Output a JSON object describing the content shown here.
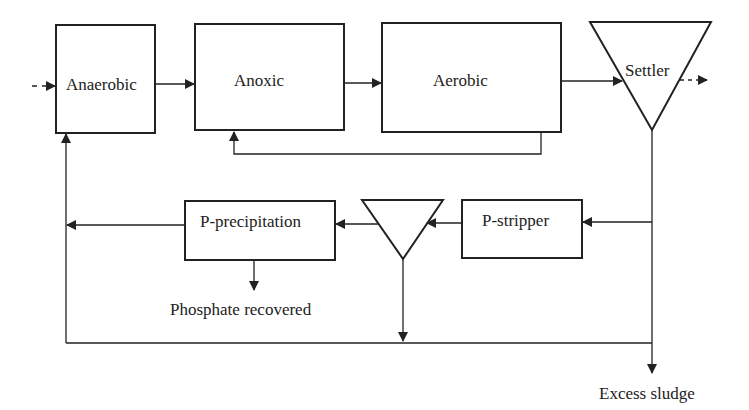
{
  "diagram": {
    "type": "process-flow",
    "stroke_color": "#222222",
    "background": "#ffffff",
    "nodes": [
      {
        "id": "anaerobic",
        "label": "Anaerobic",
        "shape": "rectangle"
      },
      {
        "id": "anoxic",
        "label": "Anoxic",
        "shape": "rectangle"
      },
      {
        "id": "aerobic",
        "label": "Aerobic",
        "shape": "rectangle"
      },
      {
        "id": "settler",
        "label": "Settler",
        "shape": "inverted-triangle"
      },
      {
        "id": "p_stripper",
        "label": "P-stripper",
        "shape": "rectangle"
      },
      {
        "id": "thickener",
        "label": "",
        "shape": "inverted-triangle"
      },
      {
        "id": "p_precipitation",
        "label": "P-precipitation",
        "shape": "rectangle"
      }
    ],
    "outputs": {
      "phosphate": "Phosphate recovered",
      "sludge": "Excess sludge"
    },
    "edges": [
      {
        "from": "influent",
        "to": "anaerobic",
        "style": "dashed"
      },
      {
        "from": "anaerobic",
        "to": "anoxic"
      },
      {
        "from": "anoxic",
        "to": "aerobic"
      },
      {
        "from": "aerobic",
        "to": "settler"
      },
      {
        "from": "settler",
        "to": "effluent",
        "style": "dashed"
      },
      {
        "from": "aerobic",
        "to": "anoxic",
        "note": "internal recycle"
      },
      {
        "from": "settler",
        "to": "p_stripper"
      },
      {
        "from": "p_stripper",
        "to": "thickener"
      },
      {
        "from": "thickener",
        "to": "p_precipitation"
      },
      {
        "from": "p_precipitation",
        "to": "anaerobic"
      },
      {
        "from": "p_precipitation",
        "to": "phosphate_recovered"
      },
      {
        "from": "thickener",
        "to": "return_line"
      },
      {
        "from": "settler",
        "to": "anaerobic",
        "note": "sludge return"
      },
      {
        "from": "settler",
        "to": "excess_sludge"
      }
    ]
  }
}
